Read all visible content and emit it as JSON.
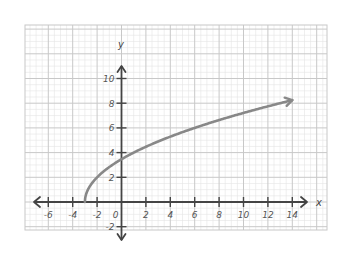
{
  "chart_data": {
    "type": "line",
    "title": "",
    "xlabel": "x",
    "ylabel": "y",
    "function": "y = 2*sqrt(x + 3)",
    "xlim": [
      -7.8,
      16.8
    ],
    "ylim": [
      -2.3,
      14.3
    ],
    "x_ticks": [
      -6,
      -4,
      -2,
      0,
      2,
      4,
      6,
      8,
      10,
      12,
      14
    ],
    "x_tick_labels": [
      "-6",
      "-4",
      "-2",
      "0",
      "2",
      "4",
      "6",
      "8",
      "10",
      "12",
      "14"
    ],
    "y_ticks": [
      -2,
      2,
      4,
      6,
      8,
      10
    ],
    "y_tick_labels": [
      "-2",
      "2",
      "4",
      "6",
      "8",
      "10"
    ],
    "grid": true,
    "series": [
      {
        "name": "curve",
        "color": "#888888",
        "x": [
          -3,
          -2.75,
          -2.5,
          -2,
          -1,
          0,
          1,
          2,
          4,
          6,
          8,
          10,
          12,
          14
        ],
        "y": [
          0,
          1.0,
          1.41,
          2.0,
          2.83,
          3.46,
          4.0,
          4.47,
          5.29,
          6.0,
          6.63,
          7.21,
          7.75,
          8.25
        ],
        "end_arrow": true
      }
    ]
  },
  "colors": {
    "axis": "#444444",
    "grid_major": "#c8c8c8",
    "grid_minor": "#e4e4e4",
    "curve": "#888888",
    "label": "#555555"
  }
}
